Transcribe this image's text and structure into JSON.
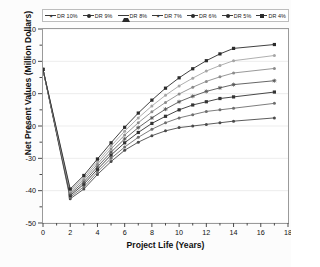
{
  "chart_data": {
    "type": "line",
    "title": "",
    "xlabel": "Project Life (Years)",
    "ylabel": "Net Present Values (Million Dollars)",
    "xlim": [
      0,
      18
    ],
    "ylim": [
      -50,
      10
    ],
    "xticks": [
      0,
      2,
      4,
      6,
      8,
      10,
      12,
      14,
      16,
      18
    ],
    "yticks": [
      10,
      0,
      -10,
      -20,
      -30,
      -40,
      -50
    ],
    "grid": true,
    "legend_position": "top",
    "x": [
      0,
      2,
      3,
      4,
      5,
      6,
      7,
      8,
      9,
      10,
      11,
      12,
      13,
      14,
      17
    ],
    "series": [
      {
        "name": "DR 10%",
        "marker": "dot",
        "color": "#4a4a4a",
        "values": [
          -2.5,
          -42.5,
          -39.5,
          -35.0,
          -31.0,
          -27.5,
          -25.0,
          -23.0,
          -21.5,
          -20.5,
          -20.0,
          -19.5,
          -19.0,
          -18.5,
          -17.5
        ]
      },
      {
        "name": "DR 9%",
        "marker": "dot",
        "color": "#6e6e6e",
        "values": [
          -2.5,
          -42.0,
          -38.8,
          -34.2,
          -30.0,
          -26.5,
          -23.5,
          -21.0,
          -19.0,
          -17.5,
          -16.5,
          -15.5,
          -15.0,
          -14.5,
          -13.0
        ]
      },
      {
        "name": "DR 8%",
        "marker": "square",
        "color": "#333333",
        "values": [
          -2.5,
          -41.5,
          -38.0,
          -33.4,
          -29.0,
          -25.2,
          -22.0,
          -19.2,
          -17.0,
          -15.0,
          -13.5,
          -12.5,
          -11.5,
          -11.0,
          -9.5
        ]
      },
      {
        "name": "DR 7%",
        "marker": "star",
        "color": "#555555",
        "values": [
          -2.5,
          -41.0,
          -37.3,
          -32.6,
          -28.1,
          -24.0,
          -20.5,
          -17.5,
          -14.8,
          -12.5,
          -10.8,
          -9.3,
          -8.2,
          -7.2,
          -6.0
        ]
      },
      {
        "name": "DR 6%",
        "marker": "dot",
        "color": "#8c8c8c",
        "values": [
          -2.5,
          -40.5,
          -36.6,
          -31.8,
          -27.1,
          -22.8,
          -19.0,
          -15.6,
          -12.7,
          -10.1,
          -8.0,
          -6.2,
          -4.8,
          -3.6,
          -2.2
        ]
      },
      {
        "name": "DR 5%",
        "marker": "dot",
        "color": "#a6a6a6",
        "values": [
          -2.5,
          -40.0,
          -36.0,
          -31.0,
          -26.2,
          -21.6,
          -17.5,
          -13.8,
          -10.5,
          -7.6,
          -5.2,
          -3.0,
          -1.3,
          0.2,
          1.8
        ]
      },
      {
        "name": "DR 4%",
        "marker": "square",
        "color": "#2b2b2b",
        "values": [
          -2.5,
          -39.5,
          -35.3,
          -30.2,
          -25.2,
          -20.4,
          -16.0,
          -12.0,
          -8.3,
          -5.1,
          -2.3,
          0.2,
          2.3,
          4.0,
          5.2
        ]
      }
    ]
  },
  "legend": {
    "items": [
      {
        "label": "DR 10%",
        "marker": "star"
      },
      {
        "label": "DR 9%",
        "marker": "dot"
      },
      {
        "label": "DR 8%",
        "marker": "triangle"
      },
      {
        "label": "DR 7%",
        "marker": "star"
      },
      {
        "label": "DR 6%",
        "marker": "dot"
      },
      {
        "label": "DR 5%",
        "marker": "dot"
      },
      {
        "label": "DR 4%",
        "marker": "square"
      }
    ]
  }
}
